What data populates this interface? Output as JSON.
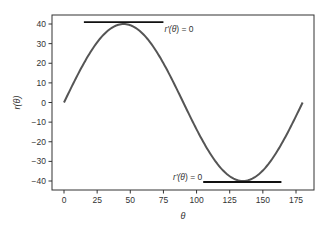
{
  "chart_data": {
    "type": "line",
    "title": "",
    "xlabel": "θ",
    "ylabel": "r(θ)",
    "xlim": [
      -7,
      188
    ],
    "ylim": [
      -45,
      45
    ],
    "xticks": [
      0,
      25,
      50,
      75,
      100,
      125,
      150,
      175
    ],
    "yticks": [
      -40,
      -30,
      -20,
      -10,
      0,
      10,
      20,
      30,
      40
    ],
    "grid": false,
    "legend": null,
    "series": [
      {
        "name": "r(θ) = 40·sin(2θ)",
        "color": "#555555",
        "x": [
          0,
          7.5,
          15,
          22.5,
          30,
          37.5,
          45,
          52.5,
          60,
          67.5,
          75,
          82.5,
          90,
          97.5,
          105,
          112.5,
          120,
          127.5,
          135,
          142.5,
          150,
          157.5,
          165,
          172.5,
          180
        ],
        "y": [
          0,
          10.35,
          20.0,
          28.28,
          34.64,
          38.64,
          40.0,
          38.64,
          34.64,
          28.28,
          20.0,
          10.35,
          0,
          -10.35,
          -20.0,
          -28.28,
          -34.64,
          -38.64,
          -40.0,
          -38.64,
          -34.64,
          -28.28,
          -20.0,
          -10.35,
          0
        ]
      }
    ],
    "annotations": [
      {
        "type": "hline-segment",
        "label": "r′(θ) = 0",
        "y": 41,
        "x_start": 15,
        "x_end": 75,
        "color": "#111111",
        "label_x": 75,
        "label_y": 36,
        "label_anchor": "start"
      },
      {
        "type": "hline-segment",
        "label": "r′(θ) = 0",
        "y": -40.5,
        "x_start": 105,
        "x_end": 164,
        "color": "#111111",
        "label_x": 105,
        "label_y": -39,
        "label_anchor": "end"
      }
    ]
  },
  "labels": {
    "xlabel": "θ",
    "ylabel": "r(θ)",
    "annot_top_prefix": "r′(",
    "annot_theta": "θ",
    "annot_suffix": ") = 0",
    "annot_bottom_prefix": "r′(",
    "annot_bottom_suffix": ") = 0"
  },
  "colors": {
    "curve": "#555555",
    "tangent": "#111111",
    "axes": "#333333",
    "text": "#333333",
    "background": "#ffffff"
  }
}
